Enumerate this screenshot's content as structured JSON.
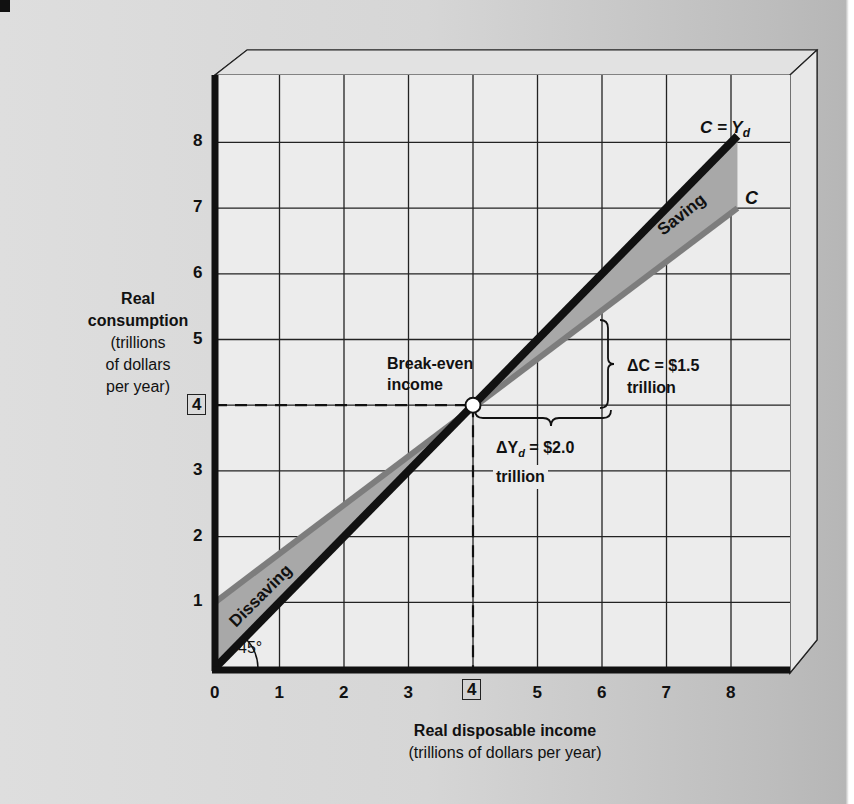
{
  "chart_data": {
    "type": "line",
    "title": "",
    "xlabel": "Real disposable income",
    "xlabel_sub": "(trillions of dollars per year)",
    "ylabel": "Real consumption",
    "ylabel_sub": [
      "(trillions",
      "of dollars",
      "per year)"
    ],
    "xlim": [
      0,
      9
    ],
    "ylim": [
      0,
      9
    ],
    "x_ticks": [
      "0",
      "1",
      "2",
      "3",
      "4",
      "5",
      "6",
      "7",
      "8"
    ],
    "y_ticks": [
      "1",
      "2",
      "3",
      "4",
      "5",
      "6",
      "7",
      "8"
    ],
    "highlighted_tick": "4",
    "grid": true,
    "series": [
      {
        "name": "C = Yd",
        "label_main": "C = Y",
        "label_sub": "d",
        "color": "#111111",
        "x": [
          0,
          8.1
        ],
        "y": [
          0,
          8.1
        ]
      },
      {
        "name": "C",
        "label_main": "C",
        "color": "#7a7a7a",
        "x": [
          0,
          8.1
        ],
        "y": [
          1.0,
          7.0
        ]
      }
    ],
    "annotations": {
      "break_even": {
        "line1": "Break-even",
        "line2": "income",
        "x": 4,
        "y": 4
      },
      "saving": "Saving",
      "dissaving": "Dissaving",
      "angle": "45°",
      "delta_c": {
        "line1": "ΔC = $1.5",
        "line2": "trillion"
      },
      "delta_yd": {
        "prefix": "ΔY",
        "sub": "d",
        "suffix": " = $2.0",
        "line2": "trillion"
      }
    }
  }
}
